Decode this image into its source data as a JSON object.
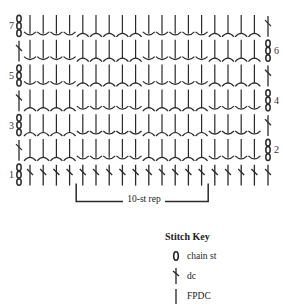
{
  "diagram": {
    "type": "crochet-stitch-chart",
    "columns": 18,
    "rows": [
      {
        "number": 7,
        "label_side": "left",
        "left_end": "chain",
        "right_end": "dc",
        "pattern": "B"
      },
      {
        "number": 6,
        "label_side": "right",
        "left_end": "dc",
        "right_end": "chain",
        "pattern": "B"
      },
      {
        "number": 5,
        "label_side": "left",
        "left_end": "chain",
        "right_end": "dc",
        "pattern": "B"
      },
      {
        "number": 4,
        "label_side": "right",
        "left_end": "dc",
        "right_end": "chain",
        "pattern": "A"
      },
      {
        "number": 3,
        "label_side": "left",
        "left_end": "chain",
        "right_end": "dc",
        "pattern": "A"
      },
      {
        "number": 2,
        "label_side": "right",
        "left_end": "dc",
        "right_end": "chain",
        "pattern": "A"
      },
      {
        "number": 1,
        "label_side": "left",
        "left_end": "chain",
        "right_end": "dc",
        "pattern": "dc"
      }
    ],
    "patterns": {
      "A": [
        "bp",
        "bp",
        "bp",
        "bp",
        "fp",
        "fp",
        "fp",
        "fp",
        "fp",
        "bp",
        "bp",
        "bp",
        "bp",
        "bp",
        "fp",
        "fp",
        "fp",
        "fp"
      ],
      "B": [
        "fp",
        "fp",
        "fp",
        "fp",
        "bp",
        "bp",
        "bp",
        "bp",
        "bp",
        "fp",
        "fp",
        "fp",
        "fp",
        "fp",
        "bp",
        "bp",
        "bp",
        "bp"
      ]
    },
    "repeat": {
      "label": "10-st rep",
      "from_col": 5,
      "to_col": 14
    },
    "line_color": "#2a2a2a"
  },
  "key": {
    "title": "Stitch Key",
    "items": [
      {
        "symbol": "chain-icon",
        "label": "chain st"
      },
      {
        "symbol": "dc-icon",
        "label": "dc"
      },
      {
        "symbol": "fpdc-icon",
        "label": "FPDC"
      }
    ]
  }
}
